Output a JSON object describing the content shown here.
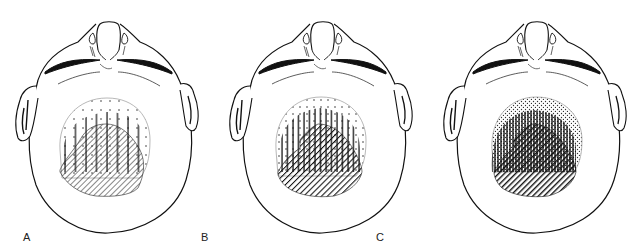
{
  "figure": {
    "panels": [
      {
        "label": "A",
        "stage": "dense-hatch minimal",
        "vertical_pattern": "sparse",
        "diagonal_pattern": "light"
      },
      {
        "label": "B",
        "stage": "moderate",
        "vertical_pattern": "medium",
        "diagonal_pattern": "medium"
      },
      {
        "label": "C",
        "stage": "dense",
        "vertical_pattern": "dense",
        "diagonal_pattern": "heavy"
      }
    ],
    "legend_patterns": [
      "dotted (outer zone)",
      "vertical lines (middle zone)",
      "diagonal hatching (inner zone)"
    ],
    "colors": {
      "ink": "#1a1a1a",
      "background": "#ffffff",
      "faint_outline": "#9a9a9a"
    }
  }
}
